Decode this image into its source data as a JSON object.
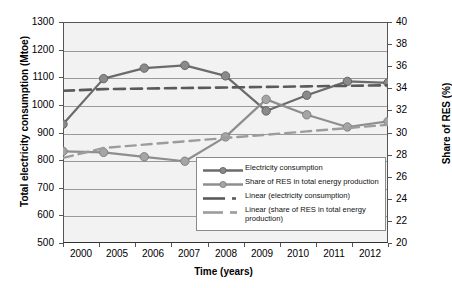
{
  "chart_data": {
    "type": "line",
    "title": "",
    "xlabel": "Time (years)",
    "ylabel": "Total electricity consumption (Mtoe)",
    "y2label": "Share of RES (%)",
    "categories": [
      "2000",
      "2005",
      "2006",
      "2007",
      "2008",
      "2009",
      "2010",
      "2011",
      "2012"
    ],
    "ylim": [
      500,
      1300
    ],
    "yticks": [
      500,
      600,
      700,
      800,
      900,
      1000,
      1100,
      1200,
      1300
    ],
    "y2lim": [
      20,
      40
    ],
    "y2ticks": [
      20,
      22,
      24,
      26,
      28,
      30,
      32,
      34,
      36,
      38,
      40
    ],
    "grid": true,
    "legend_position": "inside-bottom-right",
    "series": [
      {
        "name": "Electricity consumption",
        "axis": "left",
        "style": "solid-markers",
        "values": [
          930,
          1095,
          1133,
          1143,
          1105,
          978,
          1035,
          1085,
          1080
        ]
      },
      {
        "name": "Share of RES in total energy production",
        "axis": "right",
        "style": "solid-markers",
        "values": [
          28.3,
          28.2,
          27.8,
          27.4,
          29.6,
          33.0,
          31.6,
          30.5,
          31.0
        ]
      },
      {
        "name": "Linear (electricity consumption)",
        "axis": "left",
        "style": "dashed-trend",
        "values": [
          1051,
          1057,
          1059,
          1061,
          1063,
          1065,
          1067,
          1069,
          1071
        ]
      },
      {
        "name": "Linear (share of RES in total energy production)",
        "axis": "right",
        "style": "dashed-trend",
        "values": [
          27.7,
          28.6,
          28.9,
          29.2,
          29.5,
          29.8,
          30.1,
          30.4,
          30.7
        ]
      }
    ]
  },
  "axes": {
    "left": {
      "title": "Total electricity consumption (Mtoe)",
      "ticks": [
        "1300",
        "1200",
        "1100",
        "1000",
        "900",
        "800",
        "700",
        "600",
        "500"
      ]
    },
    "right": {
      "title": "Share of RES (%)",
      "ticks": [
        "40",
        "38",
        "36",
        "34",
        "32",
        "30",
        "28",
        "26",
        "24",
        "22",
        "20"
      ]
    },
    "bottom": {
      "title": "Time (years)",
      "ticks": [
        "2000",
        "2005",
        "2006",
        "2007",
        "2008",
        "2009",
        "2010",
        "2011",
        "2012"
      ]
    }
  },
  "legend": {
    "items": [
      {
        "label": "Electricity consumption",
        "key": "line-marker"
      },
      {
        "label": "Share of RES in total energy production",
        "key": "line-marker"
      },
      {
        "label": "Linear (electricity consumption)",
        "key": "dashed-line"
      },
      {
        "label": "Linear (share of RES in total energy production)",
        "key": "dashed-line"
      }
    ]
  },
  "colors": {
    "series1": "#6b6b6b",
    "series2": "#8e8e8e",
    "trend1": "#5a5a5a",
    "trend2": "#9c9c9c",
    "plot_bg": "#f2f2f2",
    "grid": "#9a9a9a",
    "axis": "#555555"
  }
}
